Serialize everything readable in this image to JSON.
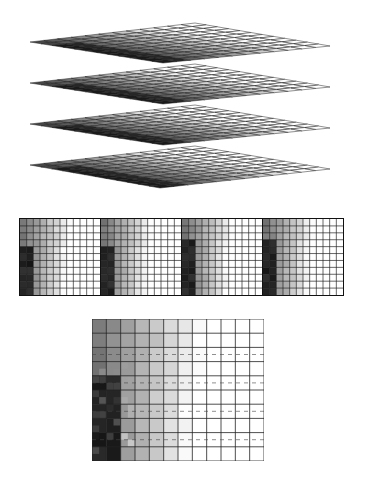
{
  "diagram": {
    "stacked_layers": {
      "count": 4,
      "grid_divisions": 12,
      "layers": [
        {
          "top": [
            195,
            23
          ],
          "right": [
            330,
            46
          ],
          "bottom": [
            163,
            63
          ],
          "left": [
            30,
            42
          ]
        },
        {
          "top": [
            195,
            64
          ],
          "right": [
            330,
            87
          ],
          "bottom": [
            163,
            104
          ],
          "left": [
            30,
            83
          ]
        },
        {
          "top": [
            195,
            105
          ],
          "right": [
            330,
            128
          ],
          "bottom": [
            163,
            145
          ],
          "left": [
            30,
            124
          ]
        },
        {
          "top": [
            195,
            146
          ],
          "right": [
            330,
            169
          ],
          "bottom": [
            160,
            188
          ],
          "left": [
            30,
            165
          ]
        }
      ],
      "dark_color": "#111111",
      "light_color": "#f4f4f4",
      "line_color": "#222222"
    },
    "strip": {
      "panel_count": 4,
      "cols": 12,
      "rows": 11,
      "panels": [
        {
          "dark_col_end": 2,
          "dark_row_start": 4
        },
        {
          "dark_col_end": 2,
          "dark_row_start": 4
        },
        {
          "dark_col_end": 2,
          "dark_row_start": 3
        },
        {
          "dark_col_end": 2,
          "dark_row_start": 3
        }
      ]
    },
    "zoomed_panel": {
      "cols": 12,
      "rows": 10,
      "dark_col_end": 2,
      "dark_row_start": 4,
      "dashed_rows": [
        2,
        4,
        6,
        8
      ]
    }
  }
}
